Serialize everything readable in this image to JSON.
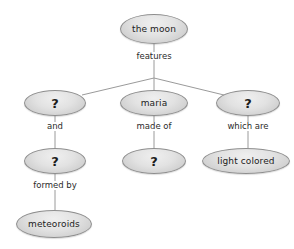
{
  "diagram": {
    "type": "concept-map",
    "background_color": "#ffffff",
    "node_fill_color": "#e2e2e2",
    "node_border_color": "#8e8e8e",
    "edge_color": "#9a9a9a",
    "text_color": "#1c1c1c",
    "nodes": [
      {
        "id": "moon",
        "label": "the moon",
        "cx": 154,
        "cy": 29,
        "rx": 34,
        "ry": 15
      },
      {
        "id": "left_q1",
        "label": "?",
        "cx": 55,
        "cy": 103,
        "rx": 31,
        "ry": 13
      },
      {
        "id": "maria",
        "label": "maria",
        "cx": 154,
        "cy": 103,
        "rx": 34,
        "ry": 13
      },
      {
        "id": "right_q1",
        "label": "?",
        "cx": 248,
        "cy": 103,
        "rx": 32,
        "ry": 13
      },
      {
        "id": "left_q2",
        "label": "?",
        "cx": 55,
        "cy": 161,
        "rx": 31,
        "ry": 13
      },
      {
        "id": "mid_q",
        "label": "?",
        "cx": 154,
        "cy": 161,
        "rx": 32,
        "ry": 13
      },
      {
        "id": "light_colored",
        "label": "light colored",
        "cx": 246,
        "cy": 161,
        "rx": 44,
        "ry": 13
      },
      {
        "id": "meteoroids",
        "label": "meteoroids",
        "cx": 54,
        "cy": 224,
        "rx": 38,
        "ry": 14
      }
    ],
    "edge_labels": [
      {
        "id": "features",
        "text": "features",
        "x": 154,
        "y": 56,
        "from": "moon",
        "to": "branch"
      },
      {
        "id": "and",
        "text": "and",
        "x": 55,
        "y": 126,
        "from": "left_q1",
        "to": "left_q2"
      },
      {
        "id": "made_of",
        "text": "made of",
        "x": 154,
        "y": 126,
        "from": "maria",
        "to": "mid_q"
      },
      {
        "id": "which_are",
        "text": "which are",
        "x": 248,
        "y": 126,
        "from": "right_q1",
        "to": "light_colored"
      },
      {
        "id": "formed_by",
        "text": "formed by",
        "x": 55,
        "y": 185,
        "from": "left_q2",
        "to": "meteoroids"
      }
    ]
  }
}
